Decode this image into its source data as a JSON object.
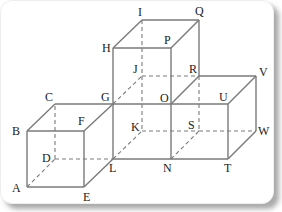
{
  "figure": {
    "line_color": "#7a7a7a",
    "vertices": {
      "A": {
        "label": "A"
      },
      "B": {
        "label": "B"
      },
      "C": {
        "label": "C"
      },
      "D": {
        "label": "D"
      },
      "E": {
        "label": "E"
      },
      "F": {
        "label": "F"
      },
      "G": {
        "label": "G"
      },
      "H": {
        "label": "H"
      },
      "I": {
        "label": "I"
      },
      "J": {
        "label": "J"
      },
      "K": {
        "label": "K"
      },
      "L": {
        "label": "L"
      },
      "N": {
        "label": "N"
      },
      "O": {
        "label": "O"
      },
      "P": {
        "label": "P"
      },
      "Q": {
        "label": "Q"
      },
      "R": {
        "label": "R"
      },
      "S": {
        "label": "S"
      },
      "T": {
        "label": "T"
      },
      "U": {
        "label": "U"
      },
      "V": {
        "label": "V"
      },
      "W": {
        "label": "W"
      }
    },
    "solid_edges": [
      [
        "A",
        "E"
      ],
      [
        "E",
        "F"
      ],
      [
        "F",
        "B"
      ],
      [
        "B",
        "A"
      ],
      [
        "B",
        "C"
      ],
      [
        "C",
        "G"
      ],
      [
        "F",
        "G"
      ],
      [
        "E",
        "L"
      ],
      [
        "G",
        "L"
      ],
      [
        "L",
        "N"
      ],
      [
        "N",
        "O"
      ],
      [
        "G",
        "O"
      ],
      [
        "G",
        "H"
      ],
      [
        "H",
        "P"
      ],
      [
        "P",
        "O"
      ],
      [
        "H",
        "I"
      ],
      [
        "I",
        "Q"
      ],
      [
        "Q",
        "P"
      ],
      [
        "Q",
        "R"
      ],
      [
        "O",
        "R"
      ],
      [
        "O",
        "U"
      ],
      [
        "U",
        "V"
      ],
      [
        "V",
        "R"
      ],
      [
        "U",
        "T"
      ],
      [
        "T",
        "N"
      ],
      [
        "T",
        "W"
      ],
      [
        "W",
        "V"
      ]
    ],
    "dashed_edges": [
      [
        "A",
        "D"
      ],
      [
        "D",
        "C"
      ],
      [
        "D",
        "L"
      ],
      [
        "I",
        "J"
      ],
      [
        "J",
        "K"
      ],
      [
        "G",
        "J"
      ],
      [
        "J",
        "R"
      ],
      [
        "L",
        "K"
      ],
      [
        "K",
        "S"
      ],
      [
        "N",
        "S"
      ],
      [
        "R",
        "S"
      ],
      [
        "S",
        "W"
      ]
    ]
  }
}
